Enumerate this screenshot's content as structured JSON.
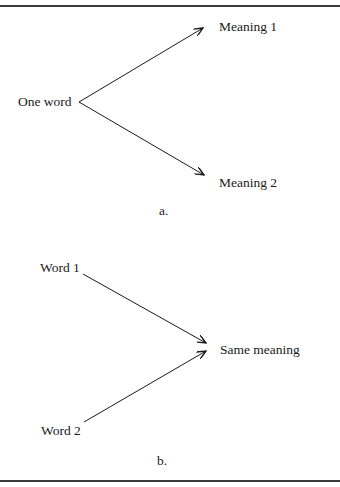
{
  "figure": {
    "panel_a": {
      "caption": "a.",
      "source": "One word",
      "targets": [
        "Meaning 1",
        "Meaning 2"
      ]
    },
    "panel_b": {
      "caption": "b.",
      "sources": [
        "Word 1",
        "Word 2"
      ],
      "target": "Same meaning"
    },
    "colors": {
      "line": "#1a1a1a",
      "rule": "#3a3a3a",
      "background": "#ffffff"
    }
  }
}
